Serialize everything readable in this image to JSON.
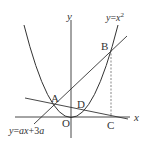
{
  "diagram": {
    "axes": {
      "x_label": "x",
      "y_label": "y",
      "origin_label": "O"
    },
    "curve": {
      "equation_label": "y = x²",
      "type": "parabola"
    },
    "line_AB": {
      "equation_label": "y = ax + 3a"
    },
    "points": {
      "A": "A",
      "B": "B",
      "C": "C",
      "D": "D",
      "O": "O"
    },
    "parts": {
      "eq_top_y": "y",
      "eq_top_eq": "=",
      "eq_top_x": "x",
      "eq_top_sup": "2",
      "eq_bot_y": "y",
      "eq_bot_eq": "=",
      "eq_bot_a": "a",
      "eq_bot_x": "x",
      "eq_bot_plus": "+3",
      "eq_bot_a2": "a"
    },
    "colors": {
      "stroke": "#333333",
      "background": "#ffffff"
    }
  }
}
